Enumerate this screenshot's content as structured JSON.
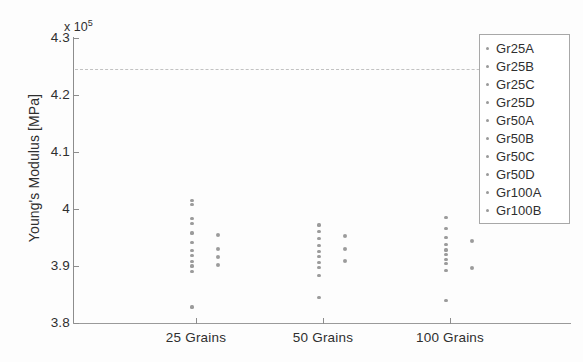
{
  "chart_data": {
    "type": "scatter",
    "title": "",
    "xlabel": "",
    "ylabel": "Young's Modulus [MPa]",
    "y_exponent_text": "x 10",
    "y_exponent_power": "5",
    "y_scale": 100000,
    "ylim": [
      3.8,
      4.3
    ],
    "yticks": [
      "3.8",
      "3.9",
      "4",
      "4.1",
      "4.2",
      "4.3"
    ],
    "ytick_values": [
      3.8,
      3.9,
      4.0,
      4.1,
      4.2,
      4.3
    ],
    "grid": false,
    "legend_position": "top-right",
    "categories": [
      "25 Grains",
      "50 Grains",
      "100 Grains"
    ],
    "category_x_values": [
      1,
      2,
      3
    ],
    "annotations": [
      {
        "name": "reference-line",
        "type": "horizontal-dashed-line",
        "value": 4.245,
        "style": "dashed",
        "color": "#c2c2c2"
      }
    ],
    "series": [
      {
        "name": "Gr25A",
        "color": "#8a8a8a",
        "points": [
          {
            "category": "25 Grains",
            "sub": 1,
            "y": 4.015
          },
          {
            "category": "25 Grains",
            "sub": 1,
            "y": 4.008
          },
          {
            "category": "50 Grains",
            "sub": 1,
            "y": 3.972
          },
          {
            "category": "100 Grains",
            "sub": 1,
            "y": 3.985
          }
        ]
      },
      {
        "name": "Gr25B",
        "color": "#8a8a8a",
        "points": [
          {
            "category": "25 Grains",
            "sub": 1,
            "y": 3.984
          },
          {
            "category": "25 Grains",
            "sub": 1,
            "y": 3.975
          },
          {
            "category": "50 Grains",
            "sub": 1,
            "y": 3.96
          },
          {
            "category": "100 Grains",
            "sub": 1,
            "y": 3.966
          }
        ]
      },
      {
        "name": "Gr25C",
        "color": "#8a8a8a",
        "points": [
          {
            "category": "25 Grains",
            "sub": 1,
            "y": 3.958
          },
          {
            "category": "25 Grains",
            "sub": 2,
            "y": 3.955
          },
          {
            "category": "50 Grains",
            "sub": 1,
            "y": 3.948
          },
          {
            "category": "50 Grains",
            "sub": 2,
            "y": 3.952
          },
          {
            "category": "100 Grains",
            "sub": 1,
            "y": 3.95
          }
        ]
      },
      {
        "name": "Gr25D",
        "color": "#8a8a8a",
        "points": [
          {
            "category": "25 Grains",
            "sub": 1,
            "y": 3.941
          },
          {
            "category": "50 Grains",
            "sub": 1,
            "y": 3.936
          },
          {
            "category": "100 Grains",
            "sub": 1,
            "y": 3.938
          },
          {
            "category": "100 Grains",
            "sub": 2,
            "y": 3.944
          }
        ]
      },
      {
        "name": "Gr50A",
        "color": "#8a8a8a",
        "points": [
          {
            "category": "25 Grains",
            "sub": 1,
            "y": 3.927
          },
          {
            "category": "25 Grains",
            "sub": 2,
            "y": 3.93
          },
          {
            "category": "50 Grains",
            "sub": 1,
            "y": 3.925
          },
          {
            "category": "50 Grains",
            "sub": 2,
            "y": 3.93
          },
          {
            "category": "100 Grains",
            "sub": 1,
            "y": 3.928
          }
        ]
      },
      {
        "name": "Gr50B",
        "color": "#8a8a8a",
        "points": [
          {
            "category": "25 Grains",
            "sub": 1,
            "y": 3.918
          },
          {
            "category": "25 Grains",
            "sub": 2,
            "y": 3.915
          },
          {
            "category": "50 Grains",
            "sub": 1,
            "y": 3.917
          },
          {
            "category": "100 Grains",
            "sub": 1,
            "y": 3.92
          }
        ]
      },
      {
        "name": "Gr50C",
        "color": "#8a8a8a",
        "points": [
          {
            "category": "25 Grains",
            "sub": 1,
            "y": 3.908
          },
          {
            "category": "50 Grains",
            "sub": 1,
            "y": 3.906
          },
          {
            "category": "50 Grains",
            "sub": 2,
            "y": 3.908
          },
          {
            "category": "100 Grains",
            "sub": 1,
            "y": 3.912
          }
        ]
      },
      {
        "name": "Gr50D",
        "color": "#8a8a8a",
        "points": [
          {
            "category": "25 Grains",
            "sub": 1,
            "y": 3.9
          },
          {
            "category": "25 Grains",
            "sub": 2,
            "y": 3.902
          },
          {
            "category": "50 Grains",
            "sub": 1,
            "y": 3.897
          },
          {
            "category": "100 Grains",
            "sub": 1,
            "y": 3.904
          },
          {
            "category": "100 Grains",
            "sub": 2,
            "y": 3.896
          }
        ]
      },
      {
        "name": "Gr100A",
        "color": "#8a8a8a",
        "points": [
          {
            "category": "25 Grains",
            "sub": 1,
            "y": 3.89
          },
          {
            "category": "50 Grains",
            "sub": 1,
            "y": 3.884
          },
          {
            "category": "100 Grains",
            "sub": 1,
            "y": 3.892
          }
        ]
      },
      {
        "name": "Gr100B",
        "color": "#8a8a8a",
        "points": [
          {
            "category": "25 Grains",
            "sub": 1,
            "y": 3.828
          },
          {
            "category": "50 Grains",
            "sub": 1,
            "y": 3.845
          },
          {
            "category": "100 Grains",
            "sub": 1,
            "y": 3.84
          }
        ]
      }
    ],
    "legend_entries": [
      "Gr25A",
      "Gr25B",
      "Gr25C",
      "Gr25D",
      "Gr50A",
      "Gr50B",
      "Gr50C",
      "Gr50D",
      "Gr100A",
      "Gr100B"
    ]
  }
}
